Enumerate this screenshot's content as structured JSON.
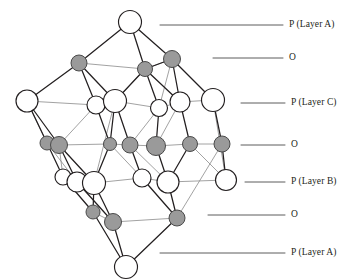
{
  "figure": {
    "background_color": "#ffffff",
    "atom_colors": {
      "p_fill": "#ffffff",
      "p_stroke": "#231f20",
      "o_fill": "#9a9a9a",
      "o_stroke": "#4a4a4a",
      "bond_dark": "#231f20",
      "bond_light": "#8a8a8a",
      "leader_line": "#4a4a4a"
    },
    "legend_note": "Open circles = P atoms, shaded circles = O atoms"
  },
  "labels": [
    {
      "id": "layer-a-top",
      "text": "P (Layer A)",
      "y": 25,
      "line_x1": 160,
      "line_x2": 283,
      "text_x": 289
    },
    {
      "id": "o-upper",
      "text": "O",
      "y": 58,
      "line_x1": 213,
      "line_x2": 283,
      "text_x": 289
    },
    {
      "id": "layer-c",
      "text": "P (Layer C)",
      "y": 103,
      "line_x1": 241,
      "line_x2": 285,
      "text_x": 291
    },
    {
      "id": "o-middle",
      "text": "O",
      "y": 145,
      "line_x1": 241,
      "line_x2": 285,
      "text_x": 291
    },
    {
      "id": "layer-b",
      "text": "P (Layer B)",
      "y": 182,
      "line_x1": 245,
      "line_x2": 285,
      "text_x": 291
    },
    {
      "id": "o-lower",
      "text": "O",
      "y": 215,
      "line_x1": 208,
      "line_x2": 285,
      "text_x": 291
    },
    {
      "id": "layer-a-bot",
      "text": "P (Layer A)",
      "y": 253,
      "line_x1": 160,
      "line_x2": 285,
      "text_x": 291
    }
  ],
  "structure": {
    "layers": [
      {
        "id": "P-A-top",
        "kind": "P",
        "label": "P (Layer A)",
        "atoms": [
          {
            "cx": 130,
            "cy": 22,
            "r": 11.5
          }
        ]
      },
      {
        "id": "O-upper",
        "kind": "O",
        "label": "O",
        "atoms": [
          {
            "cx": 79,
            "cy": 63,
            "r": 8.0
          },
          {
            "cx": 145,
            "cy": 69,
            "r": 7.5
          },
          {
            "cx": 172,
            "cy": 59,
            "r": 8.5
          }
        ]
      },
      {
        "id": "P-C",
        "kind": "P",
        "label": "P (Layer C)",
        "atoms": [
          {
            "cx": 27,
            "cy": 101,
            "r": 11.0
          },
          {
            "cx": 96,
            "cy": 105,
            "r": 9.0
          },
          {
            "cx": 115,
            "cy": 101,
            "r": 11.5
          },
          {
            "cx": 159,
            "cy": 108,
            "r": 8.5
          },
          {
            "cx": 180,
            "cy": 102,
            "r": 10.0
          },
          {
            "cx": 213,
            "cy": 100,
            "r": 11.5
          }
        ]
      },
      {
        "id": "O-middle",
        "kind": "O",
        "label": "O",
        "atoms": [
          {
            "cx": 47,
            "cy": 143,
            "r": 7.0
          },
          {
            "cx": 59,
            "cy": 145,
            "r": 8.5
          },
          {
            "cx": 110,
            "cy": 144,
            "r": 6.5
          },
          {
            "cx": 130,
            "cy": 145,
            "r": 8.0
          },
          {
            "cx": 156,
            "cy": 146,
            "r": 9.5
          },
          {
            "cx": 190,
            "cy": 144,
            "r": 7.5
          },
          {
            "cx": 222,
            "cy": 144,
            "r": 8.0
          }
        ]
      },
      {
        "id": "P-B",
        "kind": "P",
        "label": "P (Layer B)",
        "atoms": [
          {
            "cx": 63,
            "cy": 177,
            "r": 8.0
          },
          {
            "cx": 77,
            "cy": 182,
            "r": 10.0
          },
          {
            "cx": 94,
            "cy": 183,
            "r": 11.5
          },
          {
            "cx": 142,
            "cy": 178,
            "r": 9.0
          },
          {
            "cx": 168,
            "cy": 182,
            "r": 11.0
          },
          {
            "cx": 226,
            "cy": 180,
            "r": 10.5
          }
        ]
      },
      {
        "id": "O-lower",
        "kind": "O",
        "label": "O",
        "atoms": [
          {
            "cx": 93,
            "cy": 212,
            "r": 7.0
          },
          {
            "cx": 113,
            "cy": 222,
            "r": 8.5
          },
          {
            "cx": 177,
            "cy": 218,
            "r": 8.0
          }
        ]
      },
      {
        "id": "P-A-bottom",
        "kind": "P",
        "label": "P (Layer A)",
        "atoms": [
          {
            "cx": 126,
            "cy": 267,
            "r": 11.5
          }
        ]
      }
    ],
    "bonds_dark": [
      [
        130,
        22,
        79,
        63
      ],
      [
        130,
        22,
        145,
        69
      ],
      [
        130,
        22,
        172,
        59
      ],
      [
        79,
        63,
        27,
        101
      ],
      [
        79,
        63,
        96,
        105
      ],
      [
        79,
        63,
        115,
        101
      ],
      [
        145,
        69,
        115,
        101
      ],
      [
        145,
        69,
        159,
        108
      ],
      [
        145,
        69,
        180,
        102
      ],
      [
        172,
        59,
        180,
        102
      ],
      [
        172,
        59,
        213,
        100
      ],
      [
        172,
        59,
        145,
        69
      ],
      [
        27,
        101,
        47,
        143
      ],
      [
        27,
        101,
        59,
        145
      ],
      [
        96,
        105,
        110,
        144
      ],
      [
        115,
        101,
        130,
        145
      ],
      [
        115,
        101,
        110,
        144
      ],
      [
        159,
        108,
        156,
        146
      ],
      [
        180,
        102,
        190,
        144
      ],
      [
        213,
        100,
        222,
        144
      ],
      [
        47,
        143,
        63,
        177
      ],
      [
        59,
        145,
        77,
        182
      ],
      [
        59,
        145,
        94,
        183
      ],
      [
        110,
        144,
        94,
        183
      ],
      [
        130,
        145,
        142,
        178
      ],
      [
        156,
        146,
        168,
        182
      ],
      [
        190,
        144,
        168,
        182
      ],
      [
        222,
        144,
        226,
        180
      ],
      [
        63,
        177,
        93,
        212
      ],
      [
        77,
        182,
        113,
        222
      ],
      [
        94,
        183,
        113,
        222
      ],
      [
        94,
        183,
        93,
        212
      ],
      [
        142,
        178,
        177,
        218
      ],
      [
        168,
        182,
        177,
        218
      ],
      [
        93,
        212,
        126,
        267
      ],
      [
        113,
        222,
        126,
        267
      ],
      [
        177,
        218,
        126,
        267
      ]
    ],
    "bonds_light": [
      [
        79,
        63,
        145,
        69
      ],
      [
        145,
        69,
        172,
        59
      ],
      [
        27,
        101,
        96,
        105
      ],
      [
        96,
        105,
        115,
        101
      ],
      [
        115,
        101,
        159,
        108
      ],
      [
        159,
        108,
        180,
        102
      ],
      [
        180,
        102,
        213,
        100
      ],
      [
        47,
        143,
        59,
        145
      ],
      [
        59,
        145,
        110,
        144
      ],
      [
        110,
        144,
        130,
        145
      ],
      [
        130,
        145,
        156,
        146
      ],
      [
        156,
        146,
        190,
        144
      ],
      [
        190,
        144,
        222,
        144
      ],
      [
        63,
        177,
        77,
        182
      ],
      [
        77,
        182,
        94,
        183
      ],
      [
        94,
        183,
        142,
        178
      ],
      [
        142,
        178,
        168,
        182
      ],
      [
        168,
        182,
        226,
        180
      ],
      [
        93,
        212,
        113,
        222
      ],
      [
        113,
        222,
        177,
        218
      ],
      [
        27,
        101,
        47,
        143
      ],
      [
        213,
        100,
        226,
        180
      ],
      [
        96,
        105,
        59,
        145
      ],
      [
        115,
        101,
        94,
        183
      ],
      [
        159,
        108,
        130,
        145
      ],
      [
        180,
        102,
        156,
        146
      ],
      [
        110,
        144,
        142,
        178
      ],
      [
        130,
        145,
        168,
        182
      ],
      [
        222,
        144,
        177,
        218
      ],
      [
        190,
        144,
        226,
        180
      ],
      [
        47,
        143,
        77,
        182
      ],
      [
        59,
        145,
        63,
        177
      ],
      [
        115,
        101,
        145,
        69
      ],
      [
        159,
        108,
        172,
        59
      ]
    ]
  }
}
